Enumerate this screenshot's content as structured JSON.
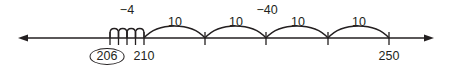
{
  "diagram": {
    "type": "number-line",
    "colors": {
      "stroke": "#231f20",
      "background": "#ffffff"
    },
    "axis": {
      "y": 38,
      "x_start": 18,
      "x_end": 434,
      "arrows": "both"
    },
    "ticks": [
      {
        "value": 206,
        "x": 110,
        "label": "206",
        "circled": true
      },
      {
        "value": 210,
        "x": 144,
        "label": "210",
        "circled": false
      },
      {
        "value": 220,
        "x": 205,
        "label": "",
        "circled": false
      },
      {
        "value": 230,
        "x": 266,
        "label": "",
        "circled": false
      },
      {
        "value": 240,
        "x": 328,
        "label": "",
        "circled": false
      },
      {
        "value": 250,
        "x": 389,
        "label": "250",
        "circled": false
      }
    ],
    "small_jumps": {
      "from": 110,
      "to": 144,
      "count": 4,
      "label": "−4"
    },
    "big_jumps": [
      {
        "from": 144,
        "to": 205,
        "label": "10"
      },
      {
        "from": 205,
        "to": 266,
        "label": "10"
      },
      {
        "from": 266,
        "to": 328,
        "label": "10"
      },
      {
        "from": 328,
        "to": 389,
        "label": "10"
      }
    ],
    "group_labels": [
      {
        "text": "−4",
        "x": 127,
        "y": 5
      },
      {
        "text": "−40",
        "x": 266,
        "y": 5
      }
    ]
  },
  "labels": {
    "small_total": "−4",
    "big_total": "−40",
    "jump1": "10",
    "jump2": "10",
    "jump3": "10",
    "jump4": "10",
    "tick_206": "206",
    "tick_210": "210",
    "tick_250": "250"
  }
}
